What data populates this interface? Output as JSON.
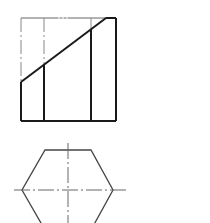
{
  "figure": {
    "type": "orthographic-projection",
    "colors": {
      "outline": "#1a1a1a",
      "thin": "#555555",
      "center": "#777777",
      "background": "#ffffff"
    }
  },
  "front_view": {
    "rect": {
      "x1": 21,
      "y1": 18,
      "x2": 116,
      "y2": 121
    },
    "inner_edges_x": [
      44,
      91
    ],
    "cut_line": {
      "x1": 21,
      "y1": 82,
      "x2": 106,
      "y2": 18
    }
  },
  "top_view": {
    "center": {
      "x": 68,
      "y": 190
    },
    "vertices": [
      [
        45,
        150
      ],
      [
        91,
        150
      ],
      [
        113,
        190
      ],
      [
        91,
        230
      ],
      [
        45,
        230
      ],
      [
        22,
        190
      ]
    ],
    "centerline_h": {
      "x1": 14,
      "x2": 126
    },
    "centerline_v": {
      "y1": 143,
      "y2": 223
    }
  }
}
